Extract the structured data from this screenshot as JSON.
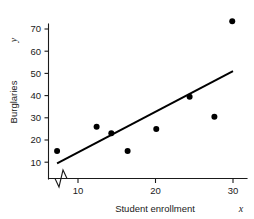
{
  "chart_data": {
    "type": "scatter",
    "title": "",
    "subtitle": "",
    "xlabel": "Student enrollment",
    "xlabel_variable": "x",
    "ylabel": "Burglaries",
    "ylabel_variable": "y",
    "xlim": [
      6.2,
      31.0
    ],
    "ylim": [
      0,
      77
    ],
    "grid": false,
    "legend": null,
    "axis_break": {
      "axis": "x",
      "symbol": "zigzag",
      "between": [
        0,
        10
      ]
    },
    "xticks": [
      10,
      20,
      30
    ],
    "xtick_labels": [
      "10",
      "20",
      "30"
    ],
    "yticks": [
      10,
      20,
      30,
      40,
      50,
      60,
      70
    ],
    "ytick_labels": [
      "10",
      "20",
      "30",
      "40",
      "50",
      "60",
      "70"
    ],
    "points": [
      {
        "x": 7.3,
        "y": 15.0
      },
      {
        "x": 12.4,
        "y": 26.0
      },
      {
        "x": 14.3,
        "y": 23.0
      },
      {
        "x": 16.4,
        "y": 15.0
      },
      {
        "x": 20.1,
        "y": 25.0
      },
      {
        "x": 24.4,
        "y": 39.5
      },
      {
        "x": 27.6,
        "y": 30.5
      },
      {
        "x": 29.9,
        "y": 73.5
      }
    ],
    "series": [
      {
        "name": "Burglaries vs student enrollment",
        "marker": "filled-circle",
        "marker_color": "#000000",
        "x": [
          7.3,
          12.4,
          14.3,
          16.4,
          20.1,
          24.4,
          27.6,
          29.9
        ],
        "values": [
          15.0,
          26.0,
          23.0,
          15.0,
          25.0,
          39.5,
          30.5,
          73.5
        ]
      }
    ],
    "trendline": {
      "type": "linear-fit",
      "color": "#000000",
      "x_start": 7.3,
      "y_start": 9.5,
      "x_end": 30.0,
      "y_end": 51.0,
      "slope": 1.83,
      "intercept": -3.85
    },
    "colors": {
      "axis": "#1a1a1a",
      "marker": "#000000",
      "line": "#000000",
      "background": "#ffffff"
    }
  }
}
